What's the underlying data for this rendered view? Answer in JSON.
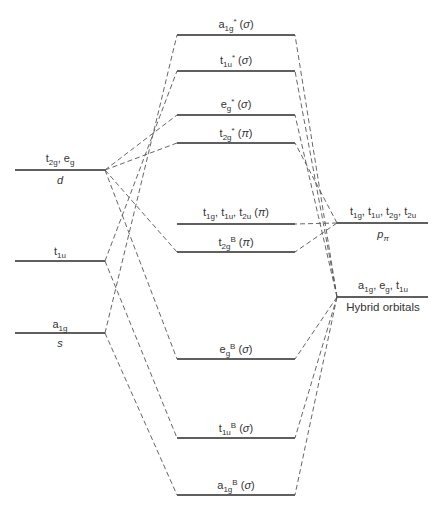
{
  "colors": {
    "level_line": "#2a2a2a",
    "connector": "#555555",
    "background": "#ffffff"
  },
  "left_levels": [
    {
      "id": "d",
      "symmetry": "t2g, eg",
      "label": "d",
      "y": 170
    },
    {
      "id": "p",
      "symmetry": "t1u",
      "label": "",
      "y": 261
    },
    {
      "id": "s",
      "symmetry": "a1g",
      "label": "s",
      "y": 333
    }
  ],
  "center_levels": [
    {
      "id": "a1g_star",
      "label": "a1g* (σ)",
      "y": 35
    },
    {
      "id": "t1u_star",
      "label": "t1u* (σ)",
      "y": 71
    },
    {
      "id": "eg_star",
      "label": "eg* (σ)",
      "y": 115
    },
    {
      "id": "t2g_star",
      "label": "t2g* (π)",
      "y": 143
    },
    {
      "id": "nonbonding_pi",
      "label": "t1g, t1u, t2u (π)",
      "y": 224
    },
    {
      "id": "t2g_B",
      "label": "t2gB (π)",
      "y": 252
    },
    {
      "id": "eg_B",
      "label": "egB (σ)",
      "y": 359
    },
    {
      "id": "t1u_B",
      "label": "t1uB (σ)",
      "y": 438
    },
    {
      "id": "a1g_B",
      "label": "a1gB (σ)",
      "y": 495
    }
  ],
  "right_levels": [
    {
      "id": "p_pi",
      "symmetry": "t1g, t1u, t2g, t2u",
      "label": "pπ",
      "y": 223
    },
    {
      "id": "hybrid",
      "symmetry": "a1g, eg, t1u",
      "label": "Hybrid orbitals",
      "y": 297
    }
  ],
  "labels": {
    "d_sym": "t2g, eg",
    "d_name": "d",
    "p_sym": "t1u",
    "s_sym": "a1g",
    "s_name": "s",
    "ppi_sym": "t1g, t1u, t2g, t2u",
    "ppi_name": "pπ",
    "hyb_sym": "a1g, eg, t1u",
    "hyb_name": "Hybrid orbitals",
    "c_a1g_star": "a1g* (σ)",
    "c_t1u_star": "t1u* (σ)",
    "c_eg_star": "eg* (σ)",
    "c_t2g_star": "t2g* (π)",
    "c_nb_pi": "t1g, t1u, t2u (π)",
    "c_t2g_B": "t2gB (π)",
    "c_eg_B": "egB (σ)",
    "c_t1u_B": "t1uB (σ)",
    "c_a1g_B": "a1gB (σ)"
  }
}
